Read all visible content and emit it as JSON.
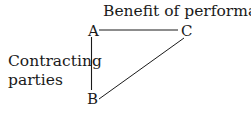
{
  "diagram": {
    "title": "Benefit of performance",
    "side_label_line1": "Contracting",
    "side_label_line2": "parties",
    "nodes": {
      "A": "A",
      "B": "B",
      "C": "C"
    },
    "edges": [
      {
        "from": "A",
        "to": "C"
      },
      {
        "from": "A",
        "to": "B"
      },
      {
        "from": "B",
        "to": "C"
      }
    ],
    "colors": {
      "ink": "#1a1a1a",
      "background": "#ffffff"
    }
  }
}
